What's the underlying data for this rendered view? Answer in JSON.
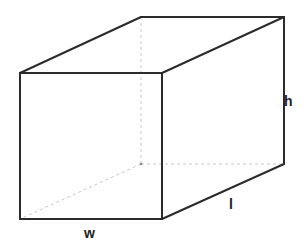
{
  "diagram": {
    "type": "rectangular-prism",
    "labels": {
      "width": "w",
      "length": "l",
      "height": "h"
    },
    "colors": {
      "visible_edge": "#2b2b2b",
      "hidden_edge": "#c8c8c8",
      "background": "#ffffff"
    }
  }
}
